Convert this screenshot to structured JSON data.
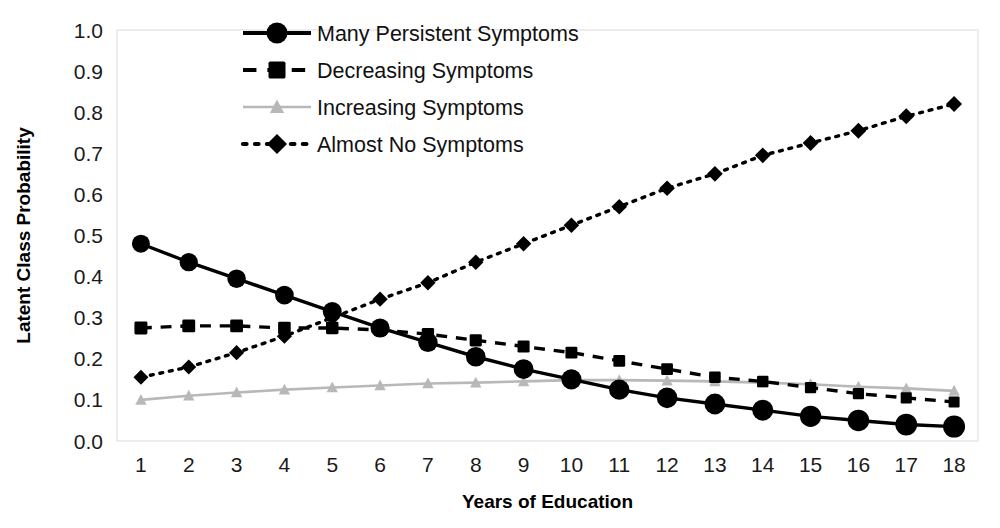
{
  "chart_data": {
    "type": "line",
    "title": "",
    "xlabel": "Years of Education",
    "ylabel": "Latent Class Probability",
    "x": [
      1,
      2,
      3,
      4,
      5,
      6,
      7,
      8,
      9,
      10,
      11,
      12,
      13,
      14,
      15,
      16,
      17,
      18
    ],
    "categories": [
      "1",
      "2",
      "3",
      "4",
      "5",
      "6",
      "7",
      "8",
      "9",
      "10",
      "11",
      "12",
      "13",
      "14",
      "15",
      "16",
      "17",
      "18"
    ],
    "xlim": [
      0.5,
      18.5
    ],
    "ylim": [
      0.0,
      1.0
    ],
    "y_ticks": [
      0.0,
      0.1,
      0.2,
      0.3,
      0.4,
      0.5,
      0.6,
      0.7,
      0.8,
      0.9,
      1.0
    ],
    "y_tick_labels": [
      "0.0",
      "0.1",
      "0.2",
      "0.3",
      "0.4",
      "0.5",
      "0.6",
      "0.7",
      "0.8",
      "0.9",
      "1.0"
    ],
    "grid": false,
    "legend_position": "upper-left-inside",
    "series": [
      {
        "name": "Many Persistent Symptoms",
        "marker": "circle",
        "linestyle": "solid",
        "color": "#000000",
        "marker_size_start": 18,
        "marker_size_end": 22,
        "values": [
          0.48,
          0.435,
          0.395,
          0.355,
          0.315,
          0.275,
          0.24,
          0.205,
          0.175,
          0.15,
          0.125,
          0.105,
          0.09,
          0.075,
          0.06,
          0.05,
          0.04,
          0.035
        ]
      },
      {
        "name": "Decreasing Symptoms",
        "marker": "square",
        "linestyle": "dashed",
        "color": "#000000",
        "marker_size_start": 13,
        "marker_size_end": 11,
        "values": [
          0.275,
          0.28,
          0.28,
          0.275,
          0.275,
          0.27,
          0.26,
          0.245,
          0.23,
          0.215,
          0.195,
          0.175,
          0.155,
          0.145,
          0.13,
          0.115,
          0.105,
          0.095
        ]
      },
      {
        "name": "Increasing Symptoms",
        "marker": "triangle",
        "linestyle": "solid",
        "color": "#b8b8b8",
        "marker_size_start": 12,
        "marker_size_end": 12,
        "values": [
          0.1,
          0.11,
          0.118,
          0.125,
          0.13,
          0.135,
          0.14,
          0.142,
          0.145,
          0.148,
          0.148,
          0.147,
          0.145,
          0.142,
          0.138,
          0.132,
          0.128,
          0.122
        ]
      },
      {
        "name": "Almost No Symptoms",
        "marker": "diamond",
        "linestyle": "dotted",
        "color": "#000000",
        "marker_size_start": 15,
        "marker_size_end": 16,
        "values": [
          0.155,
          0.18,
          0.215,
          0.255,
          0.3,
          0.345,
          0.385,
          0.435,
          0.48,
          0.525,
          0.57,
          0.615,
          0.65,
          0.695,
          0.725,
          0.755,
          0.79,
          0.82
        ]
      }
    ]
  },
  "colors": {
    "background": "#ffffff",
    "axis_line": "#e6e6e6",
    "text": "#111111",
    "series_black": "#000000",
    "series_gray": "#b8b8b8"
  },
  "legend": {
    "items": [
      {
        "label": "Many Persistent Symptoms",
        "marker": "circle",
        "linestyle": "solid",
        "color": "#000000"
      },
      {
        "label": "Decreasing Symptoms",
        "marker": "square",
        "linestyle": "dashed",
        "color": "#000000"
      },
      {
        "label": "Increasing Symptoms",
        "marker": "triangle",
        "linestyle": "solid",
        "color": "#b8b8b8"
      },
      {
        "label": "Almost No Symptoms",
        "marker": "diamond",
        "linestyle": "dotted",
        "color": "#000000"
      }
    ]
  }
}
